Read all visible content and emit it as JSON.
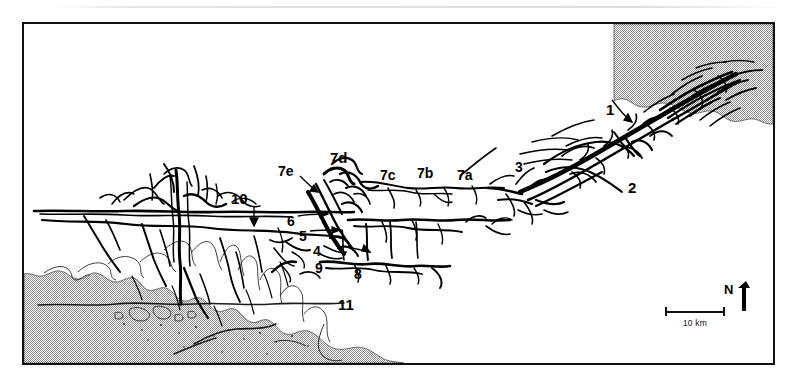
{
  "figure": {
    "type": "map"
  },
  "map": {
    "frame": {
      "present": true,
      "color": "#111111"
    },
    "sea_fill": {
      "pattern": "stipple",
      "color": "#9a9a9a"
    },
    "land_fill": {
      "color": "#ffffff"
    },
    "network_color": "#000000",
    "labels": [
      {
        "id": "label-1",
        "text": "1",
        "x": 604,
        "y": 86,
        "size": 15,
        "leader": "down-right"
      },
      {
        "id": "label-2",
        "text": "2",
        "x": 626,
        "y": 164,
        "size": 15,
        "leader": "none"
      },
      {
        "id": "label-3",
        "text": "3",
        "x": 513,
        "y": 144,
        "size": 14,
        "leader": "none"
      },
      {
        "id": "label-4",
        "text": "4",
        "x": 311,
        "y": 228,
        "size": 14,
        "leader": "right"
      },
      {
        "id": "label-5",
        "text": "5",
        "x": 297,
        "y": 213,
        "size": 14,
        "leader": "right"
      },
      {
        "id": "label-6",
        "text": "6",
        "x": 285,
        "y": 198,
        "size": 14,
        "leader": "right"
      },
      {
        "id": "label-7a",
        "text": "7a",
        "x": 455,
        "y": 152,
        "size": 14,
        "leader": "none"
      },
      {
        "id": "label-7b",
        "text": "7b",
        "x": 415,
        "y": 150,
        "size": 14,
        "leader": "none"
      },
      {
        "id": "label-7c",
        "text": "7c",
        "x": 378,
        "y": 152,
        "size": 14,
        "leader": "none"
      },
      {
        "id": "label-7d",
        "text": "7d",
        "x": 328,
        "y": 134,
        "size": 15,
        "leader": "none"
      },
      {
        "id": "label-7e",
        "text": "7e",
        "x": 290,
        "y": 164,
        "size": 14,
        "leader": "down-right"
      },
      {
        "id": "label-8",
        "text": "8",
        "x": 352,
        "y": 251,
        "size": 14,
        "leader": "none"
      },
      {
        "id": "label-9",
        "text": "9",
        "x": 313,
        "y": 245,
        "size": 14,
        "leader": "none"
      },
      {
        "id": "label-10",
        "text": "10",
        "x": 229,
        "y": 175,
        "size": 15,
        "leader": "down"
      },
      {
        "id": "label-11",
        "text": "11",
        "x": 336,
        "y": 303,
        "size": 15,
        "leader": "none"
      }
    ]
  },
  "scalebar": {
    "label": "10 km",
    "length_km": 10
  },
  "north_arrow": {
    "letter": "N"
  }
}
